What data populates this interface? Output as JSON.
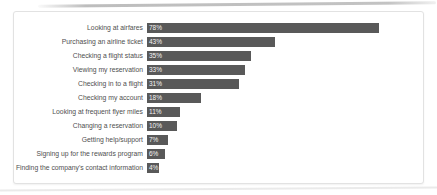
{
  "chart_data": {
    "type": "bar",
    "orientation": "horizontal",
    "title": "",
    "xlabel": "",
    "ylabel": "",
    "grid": false,
    "legend": false,
    "xlim": [
      0,
      80
    ],
    "categories": [
      "Looking at airfares",
      "Purchasing an airline ticket",
      "Checking a flight status",
      "Viewing my reservation",
      "Checking in to a flight",
      "Checking my account",
      "Looking at frequent flyer miles",
      "Changing a reservation",
      "Getting help/support",
      "Signing up for the rewards program",
      "Finding the company's contact information"
    ],
    "values": [
      78,
      43,
      35,
      33,
      31,
      18,
      11,
      10,
      7,
      6,
      4
    ],
    "value_labels": [
      "78%",
      "43%",
      "35%",
      "33%",
      "31%",
      "18%",
      "11%",
      "10%",
      "7%",
      "6%",
      "4%"
    ],
    "bar_color": "#595959",
    "value_text_color": "#f5f5f5",
    "label_color": "#4f4f4f",
    "panel_border_color": "#e2e2e2"
  }
}
